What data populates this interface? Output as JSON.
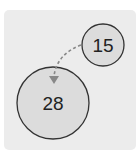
{
  "diagram": {
    "nodes": [
      {
        "id": "small",
        "label": "15",
        "cx": 103,
        "cy": 45,
        "r": 21,
        "fill": "#dcdcdc"
      },
      {
        "id": "large",
        "label": "28",
        "cx": 53,
        "cy": 103,
        "r": 36,
        "fill": "#dcdcdc"
      }
    ],
    "edge": {
      "from": "small",
      "to": "large",
      "style": "dashed",
      "color": "#888888"
    }
  }
}
